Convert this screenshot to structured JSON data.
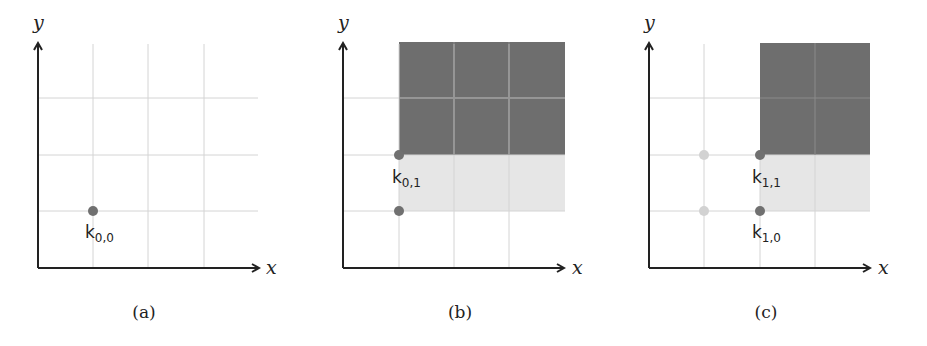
{
  "colors": {
    "axis": "#222222",
    "grid": "#d0d0d0",
    "dark_fill": "#6e6e6e",
    "light_fill": "#e6e6e6",
    "point": "#707070",
    "faded_point": "#cfcfcf"
  },
  "axes": {
    "x_label": "x",
    "y_label": "y"
  },
  "panels": [
    {
      "id": "a",
      "caption": "(a)",
      "points": [
        {
          "label": "k",
          "sub": "0,0"
        }
      ]
    },
    {
      "id": "b",
      "caption": "(b)",
      "points": [
        {
          "label": "k",
          "sub": "0,1"
        }
      ]
    },
    {
      "id": "c",
      "caption": "(c)",
      "points": [
        {
          "label": "k",
          "sub": "1,1"
        },
        {
          "label": "k",
          "sub": "1,0"
        }
      ]
    }
  ]
}
